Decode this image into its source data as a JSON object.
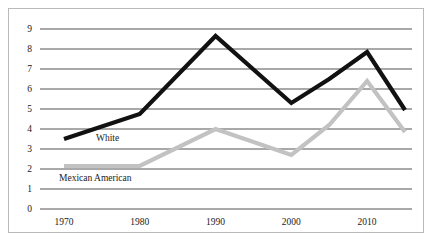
{
  "chart_data": {
    "type": "line",
    "title": "",
    "subtitle": "",
    "xlabel": "",
    "ylabel": "",
    "xlim": [
      1968,
      2016
    ],
    "ylim": [
      0,
      9
    ],
    "grid": true,
    "grid_axis": "y",
    "legend_position": "inline-labels",
    "x_ticks": [
      "1970",
      "1980",
      "1990",
      "2000",
      "2010"
    ],
    "x_tick_values": [
      1970,
      1980,
      1990,
      2000,
      2010
    ],
    "y_ticks": [
      "0",
      "1",
      "2",
      "3",
      "4",
      "5",
      "6",
      "7",
      "8",
      "9"
    ],
    "y_tick_values": [
      0,
      1,
      2,
      3,
      4,
      5,
      6,
      7,
      8,
      9
    ],
    "series": [
      {
        "name": "White",
        "color": "#111111",
        "label_text": "White",
        "x": [
          1970,
          1980,
          1990,
          2000,
          2005,
          2010,
          2015
        ],
        "values": [
          3.5,
          4.75,
          8.65,
          5.3,
          6.5,
          7.85,
          4.95
        ]
      },
      {
        "name": "Mexican American",
        "color": "#c2c2c2",
        "label_text": "Mexican American",
        "x": [
          1970,
          1980,
          1990,
          2000,
          2005,
          2010,
          2015
        ],
        "values": [
          2.15,
          2.15,
          4.0,
          2.7,
          4.2,
          6.4,
          3.85
        ]
      }
    ],
    "annotations": [
      {
        "text": "White",
        "x_px": 96,
        "y_px": 133
      },
      {
        "text": "Mexican American",
        "x_px": 59,
        "y_px": 173
      }
    ]
  },
  "colors": {
    "frame": "#b9b9b9",
    "gridline": "#3f3f3f",
    "white_series": "#111111",
    "mexican_american_series": "#c2c2c2",
    "background": "#ffffff",
    "text": "#222222"
  }
}
